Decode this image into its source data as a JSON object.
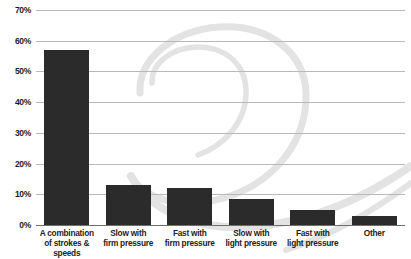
{
  "chart_data": {
    "type": "bar",
    "title": "",
    "subtitle": "",
    "xlabel": "",
    "ylabel": "",
    "categories": [
      "A combination of strokes & speeds",
      "Slow with firm pressure",
      "Fast with firm pressure",
      "Slow with light pressure",
      "Fast with light pressure",
      "Other"
    ],
    "category_lines": [
      [
        "A combination",
        "of strokes &",
        "speeds"
      ],
      [
        "Slow with",
        "firm pressure"
      ],
      [
        "Fast with",
        "firm pressure"
      ],
      [
        "Slow with",
        "light pressure"
      ],
      [
        "Fast with",
        "light pressure"
      ],
      [
        "Other"
      ]
    ],
    "values": [
      57,
      13,
      12,
      8.5,
      5,
      3
    ],
    "value_labels": [
      "57%",
      "13%",
      "12%",
      "8.5%",
      "5%",
      "3%"
    ],
    "ylim": [
      0,
      70
    ],
    "ytick_values": [
      0,
      10,
      20,
      30,
      40,
      50,
      60,
      70
    ],
    "ytick_labels": [
      "0%",
      "10%",
      "20%",
      "30%",
      "40%",
      "50%",
      "60%",
      "70%"
    ],
    "grid": true,
    "legend": false,
    "legend_position": "none",
    "bar_color": "#2b2b2b",
    "gridline_color": "#b9b9b9",
    "axis_color": "#6e6e6e",
    "background_color": "#ffffff",
    "watermark_color": "#e3e3e3",
    "watermark_name": "spiral-swoosh-watermark"
  }
}
